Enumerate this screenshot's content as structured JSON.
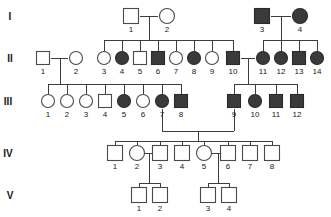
{
  "chart_data": {
    "type": "diagram",
    "legend": {
      "square": "male",
      "circle": "female",
      "filled": "affected",
      "open": "unaffected"
    },
    "generation_labels": [
      "I",
      "II",
      "III",
      "IV",
      "V"
    ],
    "generations": [
      {
        "label": "I",
        "y": 16,
        "label_x": 10,
        "individuals": [
          {
            "id": "I-1",
            "number": "1",
            "sex": "male",
            "affected": false,
            "x": 131
          },
          {
            "id": "I-2",
            "number": "2",
            "sex": "female",
            "affected": false,
            "x": 167
          },
          {
            "id": "I-3",
            "number": "3",
            "sex": "male",
            "affected": true,
            "x": 262
          },
          {
            "id": "I-4",
            "number": "4",
            "sex": "female",
            "affected": true,
            "x": 300
          }
        ]
      },
      {
        "label": "II",
        "y": 58,
        "label_x": 10,
        "individuals": [
          {
            "id": "II-1",
            "number": "1",
            "sex": "male",
            "affected": false,
            "x": 43
          },
          {
            "id": "II-2",
            "number": "2",
            "sex": "female",
            "affected": false,
            "x": 76
          },
          {
            "id": "II-3",
            "number": "3",
            "sex": "female",
            "affected": false,
            "x": 104
          },
          {
            "id": "II-4",
            "number": "4",
            "sex": "female",
            "affected": true,
            "x": 122
          },
          {
            "id": "II-5",
            "number": "5",
            "sex": "male",
            "affected": false,
            "x": 140
          },
          {
            "id": "II-6",
            "number": "6",
            "sex": "male",
            "affected": true,
            "x": 158
          },
          {
            "id": "II-7",
            "number": "7",
            "sex": "female",
            "affected": false,
            "x": 176
          },
          {
            "id": "II-8",
            "number": "8",
            "sex": "female",
            "affected": true,
            "x": 194
          },
          {
            "id": "II-9",
            "number": "9",
            "sex": "female",
            "affected": false,
            "x": 212
          },
          {
            "id": "II-10",
            "number": "10",
            "sex": "male",
            "affected": true,
            "x": 233
          },
          {
            "id": "II-11",
            "number": "11",
            "sex": "female",
            "affected": true,
            "x": 263
          },
          {
            "id": "II-12",
            "number": "12",
            "sex": "female",
            "affected": true,
            "x": 281
          },
          {
            "id": "II-13",
            "number": "13",
            "sex": "male",
            "affected": true,
            "x": 299
          },
          {
            "id": "II-14",
            "number": "14",
            "sex": "female",
            "affected": true,
            "x": 317
          }
        ]
      },
      {
        "label": "III",
        "y": 101,
        "label_x": 8,
        "individuals": [
          {
            "id": "III-1",
            "number": "1",
            "sex": "female",
            "affected": false,
            "x": 48
          },
          {
            "id": "III-2",
            "number": "2",
            "sex": "female",
            "affected": false,
            "x": 67
          },
          {
            "id": "III-3",
            "number": "3",
            "sex": "female",
            "affected": false,
            "x": 86
          },
          {
            "id": "III-4",
            "number": "4",
            "sex": "male",
            "affected": false,
            "x": 105
          },
          {
            "id": "III-5",
            "number": "5",
            "sex": "female",
            "affected": true,
            "x": 124
          },
          {
            "id": "III-6",
            "number": "6",
            "sex": "female",
            "affected": false,
            "x": 143
          },
          {
            "id": "III-7",
            "number": "7",
            "sex": "female",
            "affected": true,
            "x": 162
          },
          {
            "id": "III-8",
            "number": "8",
            "sex": "male",
            "affected": true,
            "x": 181
          },
          {
            "id": "III-9",
            "number": "9",
            "sex": "male",
            "affected": true,
            "x": 234
          },
          {
            "id": "III-10",
            "number": "10",
            "sex": "female",
            "affected": true,
            "x": 255
          },
          {
            "id": "III-11",
            "number": "11",
            "sex": "male",
            "affected": true,
            "x": 276
          },
          {
            "id": "III-12",
            "number": "12",
            "sex": "male",
            "affected": true,
            "x": 297
          }
        ]
      },
      {
        "label": "IV",
        "y": 153,
        "label_x": 8,
        "individuals": [
          {
            "id": "IV-1",
            "number": "1",
            "sex": "male",
            "affected": false,
            "x": 115
          },
          {
            "id": "IV-2",
            "number": "2",
            "sex": "female",
            "affected": false,
            "x": 137
          },
          {
            "id": "IV-3",
            "number": "3",
            "sex": "male",
            "affected": false,
            "x": 160
          },
          {
            "id": "IV-4",
            "number": "4",
            "sex": "male",
            "affected": false,
            "x": 182
          },
          {
            "id": "IV-5",
            "number": "5",
            "sex": "female",
            "affected": false,
            "x": 204
          },
          {
            "id": "IV-6",
            "number": "6",
            "sex": "male",
            "affected": false,
            "x": 228
          },
          {
            "id": "IV-7",
            "number": "7",
            "sex": "male",
            "affected": false,
            "x": 250
          },
          {
            "id": "IV-8",
            "number": "8",
            "sex": "male",
            "affected": false,
            "x": 272
          }
        ]
      },
      {
        "label": "V",
        "y": 195,
        "label_x": 10,
        "individuals": [
          {
            "id": "V-1",
            "number": "1",
            "sex": "male",
            "affected": false,
            "x": 139
          },
          {
            "id": "V-2",
            "number": "2",
            "sex": "male",
            "affected": false,
            "x": 160
          },
          {
            "id": "V-3",
            "number": "3",
            "sex": "male",
            "affected": false,
            "x": 208
          },
          {
            "id": "V-4",
            "number": "4",
            "sex": "male",
            "affected": false,
            "x": 229
          }
        ]
      }
    ],
    "connectors": [
      {
        "name": "mating-I-1-I-2",
        "type": "mating",
        "points": "140,16 158,16"
      },
      {
        "name": "descent-I-1-I-2",
        "type": "descent",
        "points": "149,16 149,40"
      },
      {
        "name": "sibship-II-3-to-II-10",
        "type": "sibship",
        "points": "104,40 233,40"
      },
      {
        "name": "drop-II-3",
        "type": "drop",
        "points": "104,40 104,51"
      },
      {
        "name": "drop-II-4",
        "type": "drop",
        "points": "122,40 122,51"
      },
      {
        "name": "drop-II-5",
        "type": "drop",
        "points": "140,40 140,51"
      },
      {
        "name": "drop-II-6",
        "type": "drop",
        "points": "158,40 158,51"
      },
      {
        "name": "drop-II-7",
        "type": "drop",
        "points": "176,40 176,51"
      },
      {
        "name": "drop-II-8",
        "type": "drop",
        "points": "194,40 194,51"
      },
      {
        "name": "drop-II-9",
        "type": "drop",
        "points": "212,40 212,51"
      },
      {
        "name": "drop-II-10",
        "type": "drop",
        "points": "233,40 233,51"
      },
      {
        "name": "mating-I-3-I-4",
        "type": "mating",
        "points": "271,16 291,16"
      },
      {
        "name": "descent-I-3-I-4",
        "type": "descent",
        "points": "281,16 281,40"
      },
      {
        "name": "sibship-II-11-to-II-14",
        "type": "sibship",
        "points": "263,40 317,40"
      },
      {
        "name": "drop-II-11",
        "type": "drop",
        "points": "263,40 263,51"
      },
      {
        "name": "drop-II-12",
        "type": "drop",
        "points": "281,40 281,51"
      },
      {
        "name": "drop-II-13",
        "type": "drop",
        "points": "299,40 299,51"
      },
      {
        "name": "drop-II-14",
        "type": "drop",
        "points": "317,40 317,51"
      },
      {
        "name": "mating-II-1-II-2",
        "type": "mating",
        "points": "51,58 68,58"
      },
      {
        "name": "descent-II-1-II-2",
        "type": "descent",
        "points": "60,58 60,84"
      },
      {
        "name": "sibship-III-1-to-III-8",
        "type": "sibship",
        "points": "48,84 181,84"
      },
      {
        "name": "drop-III-1",
        "type": "drop",
        "points": "48,84 48,94"
      },
      {
        "name": "drop-III-2",
        "type": "drop",
        "points": "67,84 67,94"
      },
      {
        "name": "drop-III-3",
        "type": "drop",
        "points": "86,84 86,94"
      },
      {
        "name": "drop-III-4",
        "type": "drop",
        "points": "105,84 105,94"
      },
      {
        "name": "drop-III-5",
        "type": "drop",
        "points": "124,84 124,94"
      },
      {
        "name": "drop-III-6",
        "type": "drop",
        "points": "143,84 143,94"
      },
      {
        "name": "drop-III-7",
        "type": "drop",
        "points": "162,84 162,94"
      },
      {
        "name": "drop-III-8",
        "type": "drop",
        "points": "181,84 181,94"
      },
      {
        "name": "mating-II-10-II-11",
        "type": "mating",
        "points": "241,58 255,58"
      },
      {
        "name": "descent-II-10-II-11",
        "type": "descent",
        "points": "248,58 248,84"
      },
      {
        "name": "sibship-III-9-to-III-12",
        "type": "sibship",
        "points": "234,84 297,84"
      },
      {
        "name": "drop-III-9",
        "type": "drop",
        "points": "234,84 234,94"
      },
      {
        "name": "drop-III-10",
        "type": "drop",
        "points": "255,84 255,94"
      },
      {
        "name": "drop-III-11",
        "type": "drop",
        "points": "276,84 276,94"
      },
      {
        "name": "drop-III-12",
        "type": "drop",
        "points": "297,84 297,94"
      },
      {
        "name": "mating-III-7-III-9-left",
        "type": "descent",
        "points": "162,109 162,131"
      },
      {
        "name": "mating-III-7-III-9-bar",
        "type": "mating",
        "points": "162,131 234,131"
      },
      {
        "name": "mating-III-7-III-9-right",
        "type": "descent",
        "points": "234,109 234,131"
      },
      {
        "name": "descent-III-7-III-9",
        "type": "descent",
        "points": "198,131 198,141"
      },
      {
        "name": "sibship-IV-1-to-IV-8",
        "type": "sibship",
        "points": "115,141 272,141"
      },
      {
        "name": "drop-IV-1",
        "type": "drop",
        "points": "115,141 115,146"
      },
      {
        "name": "drop-IV-2",
        "type": "drop",
        "points": "137,141 137,146"
      },
      {
        "name": "drop-IV-3",
        "type": "drop",
        "points": "160,141 160,146"
      },
      {
        "name": "drop-IV-4",
        "type": "drop",
        "points": "182,141 182,146"
      },
      {
        "name": "drop-IV-5",
        "type": "drop",
        "points": "204,141 204,146"
      },
      {
        "name": "drop-IV-6",
        "type": "drop",
        "points": "228,141 228,146"
      },
      {
        "name": "drop-IV-7",
        "type": "drop",
        "points": "250,141 250,146"
      },
      {
        "name": "drop-IV-8",
        "type": "drop",
        "points": "272,141 272,146"
      },
      {
        "name": "mating-IV-2-IV-3",
        "type": "mating",
        "points": "145,153 152,153"
      },
      {
        "name": "descent-IV-2-IV-3",
        "type": "descent",
        "points": "149,153 149,183"
      },
      {
        "name": "sibship-V-1-V-2",
        "type": "sibship",
        "points": "139,183 160,183"
      },
      {
        "name": "drop-V-1",
        "type": "drop",
        "points": "139,183 139,188"
      },
      {
        "name": "drop-V-2",
        "type": "drop",
        "points": "160,183 160,188"
      },
      {
        "name": "mating-IV-5-IV-6",
        "type": "mating",
        "points": "212,153 220,153"
      },
      {
        "name": "descent-IV-5-IV-6",
        "type": "descent",
        "points": "218,153 218,183"
      },
      {
        "name": "sibship-V-3-V-4",
        "type": "sibship",
        "points": "208,183 229,183"
      },
      {
        "name": "drop-V-3",
        "type": "drop",
        "points": "208,183 208,188"
      },
      {
        "name": "drop-V-4",
        "type": "drop",
        "points": "229,183 229,188"
      }
    ],
    "symbol_size": {
      "square_side": 15,
      "circle_radius": 7.5,
      "square_side_small": 13,
      "circle_radius_small": 6.5
    }
  }
}
